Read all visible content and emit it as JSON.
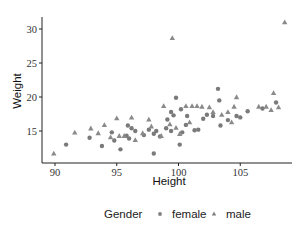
{
  "chart_data": {
    "type": "scatter",
    "title": "",
    "xlabel": "Height",
    "ylabel": "Weight",
    "xlim": [
      89.2,
      109
    ],
    "ylim": [
      11,
      31.5
    ],
    "x_ticks": [
      90,
      95,
      100,
      105
    ],
    "y_ticks": [
      15,
      20,
      25,
      30
    ],
    "grid": false,
    "legend": {
      "position": "bottom",
      "title": "Gender",
      "entries": [
        {
          "label": "female",
          "marker": "circle",
          "color": "#7f7f7f"
        },
        {
          "label": "male",
          "marker": "triangle",
          "color": "#7f7f7f"
        }
      ]
    },
    "series": [
      {
        "name": "female",
        "marker": "circle",
        "points": [
          [
            90.9,
            13.0
          ],
          [
            92.8,
            14.0
          ],
          [
            93.8,
            12.8
          ],
          [
            94.8,
            13.6
          ],
          [
            95.3,
            12.3
          ],
          [
            94.6,
            14.8
          ],
          [
            95.8,
            14.3
          ],
          [
            96.0,
            13.9
          ],
          [
            96.5,
            15.0
          ],
          [
            97.2,
            14.4
          ],
          [
            97.6,
            15.2
          ],
          [
            95.9,
            15.8
          ],
          [
            96.2,
            15.4
          ],
          [
            98.2,
            15.0
          ],
          [
            98.0,
            14.6
          ],
          [
            98.5,
            14.2
          ],
          [
            98.0,
            11.7
          ],
          [
            99.0,
            15.4
          ],
          [
            99.4,
            15.0
          ],
          [
            99.1,
            16.7
          ],
          [
            99.6,
            17.3
          ],
          [
            99.8,
            19.9
          ],
          [
            99.4,
            17.8
          ],
          [
            100.1,
            13.0
          ],
          [
            100.3,
            14.8
          ],
          [
            100.6,
            15.9
          ],
          [
            100.7,
            17.2
          ],
          [
            100.2,
            18.2
          ],
          [
            101.6,
            15.2
          ],
          [
            102.0,
            16.8
          ],
          [
            102.3,
            17.4
          ],
          [
            102.8,
            17.2
          ],
          [
            103.3,
            19.5
          ],
          [
            103.4,
            15.8
          ],
          [
            104.0,
            16.6
          ],
          [
            103.2,
            21.2
          ],
          [
            105.0,
            17.0
          ],
          [
            105.6,
            17.9
          ],
          [
            106.8,
            18.3
          ],
          [
            107.9,
            19.2
          ],
          [
            104.7,
            17.2
          ],
          [
            101.3,
            15.1
          ]
        ]
      },
      {
        "name": "male",
        "marker": "triangle",
        "points": [
          [
            89.9,
            11.7
          ],
          [
            91.6,
            14.8
          ],
          [
            92.9,
            15.4
          ],
          [
            93.5,
            14.7
          ],
          [
            94.0,
            15.9
          ],
          [
            94.5,
            14.1
          ],
          [
            95.0,
            16.9
          ],
          [
            95.2,
            14.3
          ],
          [
            95.6,
            14.3
          ],
          [
            96.5,
            13.7
          ],
          [
            97.1,
            14.7
          ],
          [
            97.6,
            16.7
          ],
          [
            97.8,
            15.7
          ],
          [
            98.6,
            14.3
          ],
          [
            99.3,
            16.0
          ],
          [
            99.5,
            28.7
          ],
          [
            99.8,
            15.5
          ],
          [
            100.1,
            14.6
          ],
          [
            100.6,
            18.7
          ],
          [
            101.1,
            18.7
          ],
          [
            101.5,
            18.7
          ],
          [
            101.9,
            18.6
          ],
          [
            102.5,
            18.5
          ],
          [
            102.8,
            17.8
          ],
          [
            103.5,
            17.4
          ],
          [
            104.0,
            17.8
          ],
          [
            104.3,
            16.3
          ],
          [
            104.5,
            18.6
          ],
          [
            104.7,
            20.0
          ],
          [
            106.5,
            18.6
          ],
          [
            107.1,
            18.6
          ],
          [
            107.5,
            18.1
          ],
          [
            107.7,
            20.6
          ],
          [
            108.1,
            18.5
          ],
          [
            108.6,
            31.0
          ],
          [
            98.8,
            18.7
          ],
          [
            100.9,
            16.3
          ],
          [
            96.2,
            17.0
          ]
        ]
      }
    ]
  }
}
